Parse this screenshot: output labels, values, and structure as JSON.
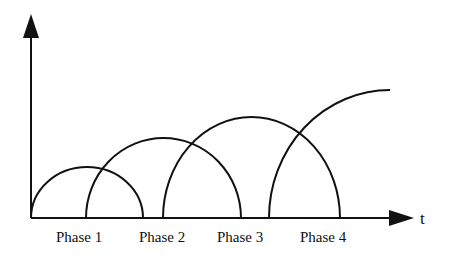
{
  "diagram": {
    "x_axis_label": "t",
    "y_axis_label": "",
    "phases": [
      {
        "label": "Phase 1",
        "start_x": 31,
        "end_x": 143,
        "peak_y": 167
      },
      {
        "label": "Phase 2",
        "start_x": 86,
        "end_x": 241,
        "peak_y": 138
      },
      {
        "label": "Phase 3",
        "start_x": 163,
        "end_x": 340,
        "peak_y": 117
      },
      {
        "label": "Phase 4",
        "start_x": 269,
        "end_x": 390,
        "peak_y": 90,
        "open_ended": true
      }
    ],
    "colors": {
      "line": "#111111",
      "background": "#ffffff"
    }
  }
}
